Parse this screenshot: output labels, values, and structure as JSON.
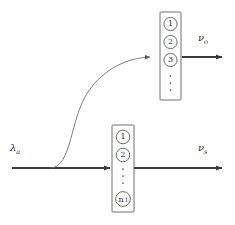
{
  "figure": {
    "type": "diagram",
    "title": "",
    "background_color": "#ffffff",
    "line_color": "#3a3a3a",
    "thin_line_color": "#707070",
    "box_stroke_color": "#6e6e6e",
    "text_color": "#2b2b2b"
  },
  "labels": {
    "input": {
      "symbol": "λ",
      "subscript": "a"
    },
    "output_top": {
      "symbol": "ν",
      "subscript": "o"
    },
    "output_bottom": {
      "symbol": "ν",
      "subscript": "s"
    }
  },
  "boxes": {
    "top": {
      "name": "upper-level-stack",
      "nodes": [
        {
          "label": "1"
        },
        {
          "label": "2"
        },
        {
          "label": "3"
        }
      ],
      "ellipsis": "⋮"
    },
    "bottom": {
      "name": "lower-level-stack",
      "nodes": [
        {
          "label": "1"
        },
        {
          "label": "2"
        }
      ],
      "ellipsis": "⋮",
      "last_node": {
        "base": "n",
        "subscript": "1"
      }
    }
  },
  "connections": {
    "main_beam": "horizontal",
    "branch": "s-curve"
  }
}
